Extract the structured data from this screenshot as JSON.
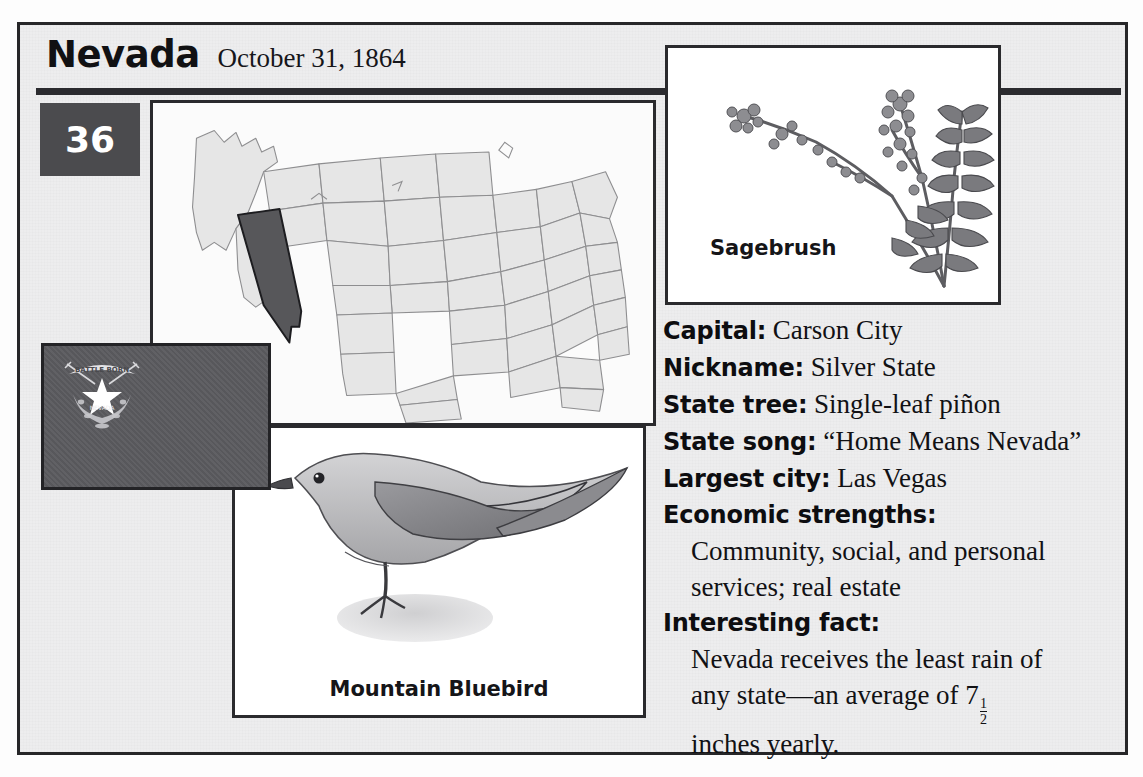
{
  "header": {
    "state_name": "Nevada",
    "statehood_date": "October 31, 1864",
    "order_number": "36"
  },
  "panels": {
    "map": {
      "name": "united-states-map",
      "highlighted_state": "Nevada"
    },
    "flag": {
      "name": "nevada-state-flag",
      "motto_banner": "BATTLE BORN",
      "emblem_star": "star"
    },
    "bird": {
      "caption": "Mountain Bluebird"
    },
    "sagebrush": {
      "caption": "Sagebrush"
    }
  },
  "facts": [
    {
      "label": "Capital:",
      "value": "Carson City"
    },
    {
      "label": "Nickname:",
      "value": "Silver State"
    },
    {
      "label": "State tree:",
      "value": "Single-leaf piñon"
    },
    {
      "label": "State song:",
      "value": "“Home Means Nevada”"
    },
    {
      "label": "Largest city:",
      "value": "Las Vegas"
    }
  ],
  "blocks": [
    {
      "label": "Economic strengths:",
      "lines": [
        "Community, social, and personal",
        "services; real estate"
      ]
    },
    {
      "label": "Interesting fact:",
      "line1": "Nevada receives the least rain of",
      "line2_pre": "any state—an average of 7",
      "fraction_numerator": "1",
      "fraction_denominator": "2",
      "line3": "inches yearly."
    }
  ],
  "colors": {
    "frame_border": "#262628",
    "badge_bg": "#4b4b4e",
    "badge_text": "#ffffff",
    "rule": "#2b2b2f",
    "flag_field": "#5a5a5d",
    "map_state_fill": "#ececec",
    "map_highlight_fill": "#57575a",
    "page_bg": "#ececed"
  }
}
